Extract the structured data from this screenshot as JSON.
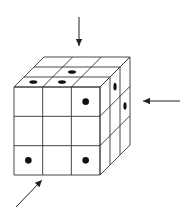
{
  "figure": {
    "grid_size": 3,
    "colors": {
      "line": "#333333",
      "dot": "#111111",
      "background": "#ffffff"
    },
    "front_face": {
      "x0": 14,
      "y0": 87,
      "x1": 100,
      "y1": 175
    },
    "depth_offset": {
      "dx": 30,
      "dy": -30
    },
    "dots": {
      "top": [
        {
          "row_from_front": 0,
          "col": 0
        },
        {
          "row_from_front": 0,
          "col": 1
        },
        {
          "row_from_front": 1,
          "col": 1
        }
      ],
      "front": [
        {
          "row": 0,
          "col": 2
        },
        {
          "row": 2,
          "col": 0
        },
        {
          "row": 2,
          "col": 2
        }
      ],
      "right": [
        {
          "row": 0,
          "depth": 1
        },
        {
          "row": 1,
          "depth": 2
        }
      ]
    },
    "arrows": [
      {
        "name": "top-view-arrow",
        "direction": "down",
        "from": [
          79,
          17
        ],
        "to": [
          79,
          46
        ]
      },
      {
        "name": "right-view-arrow",
        "direction": "left",
        "from": [
          180,
          101
        ],
        "to": [
          143,
          101
        ]
      },
      {
        "name": "front-view-arrow",
        "direction": "up-right",
        "from": [
          16,
          207
        ],
        "to": [
          42,
          180
        ]
      }
    ]
  }
}
